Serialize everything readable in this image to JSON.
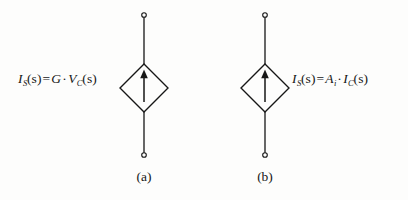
{
  "figure": {
    "background_color": "#fdfdfc",
    "ink_color": "#161616",
    "stroke_width": 1.3
  },
  "circuits": [
    {
      "id": "a",
      "caption": "(a)",
      "symbol_name": "diamond-dependent-current-source",
      "arrow_direction": "up",
      "center_x": 144,
      "center_y": 88,
      "diamond_half_width": 24,
      "diamond_half_height": 24,
      "top_terminal_y": 15,
      "bottom_terminal_y": 155,
      "terminal_radius": 2.3,
      "equation_side": "left",
      "equation": {
        "lhs_symbol": "I",
        "lhs_subscript": "S",
        "lhs_arg": "(s)",
        "equals": "=",
        "rhs_first_symbol": "G",
        "rhs_first_subscript": "",
        "multiply": "·",
        "rhs_second_symbol": "V",
        "rhs_second_subscript": "C",
        "rhs_second_arg": "(s)",
        "plain_text": "I_S(s) = G · V_C(s)"
      }
    },
    {
      "id": "b",
      "caption": "(b)",
      "symbol_name": "diamond-dependent-current-source",
      "arrow_direction": "up",
      "center_x": 265,
      "center_y": 88,
      "diamond_half_width": 24,
      "diamond_half_height": 24,
      "top_terminal_y": 15,
      "bottom_terminal_y": 155,
      "terminal_radius": 2.3,
      "equation_side": "right",
      "equation": {
        "lhs_symbol": "I",
        "lhs_subscript": "S",
        "lhs_arg": "(s)",
        "equals": "=",
        "rhs_first_symbol": "A",
        "rhs_first_subscript": "i",
        "multiply": "·",
        "rhs_second_symbol": "I",
        "rhs_second_subscript": "C",
        "rhs_second_arg": "(s)",
        "plain_text": "I_S(s) = A_i · I_C(s)"
      }
    }
  ]
}
